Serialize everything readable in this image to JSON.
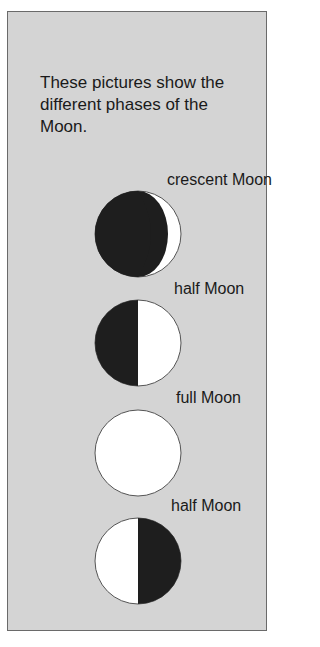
{
  "intro_text": "These pictures show the different phases of the Moon.",
  "phases": [
    {
      "label": "crescent Moon",
      "type": "crescent"
    },
    {
      "label": "half Moon",
      "type": "half-left-dark"
    },
    {
      "label": "full Moon",
      "type": "full"
    },
    {
      "label": "half Moon",
      "type": "half-right-dark"
    }
  ],
  "colors": {
    "panel": "#d4d4d4",
    "dark": "#1e1e1e",
    "light": "#ffffff",
    "border": "#6a6a6a"
  }
}
